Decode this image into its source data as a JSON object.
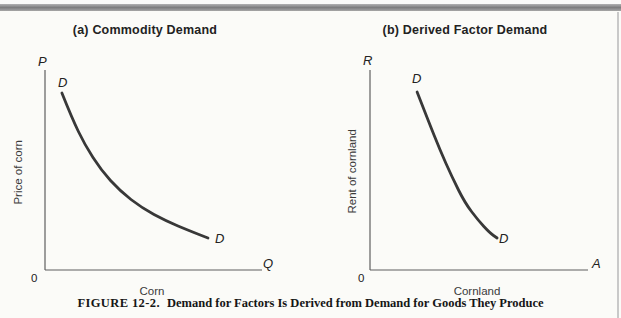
{
  "colors": {
    "paper": "#fbfbf8",
    "curve": "#383838",
    "axis": "#5f5f5f",
    "text": "#222222",
    "top_rule": "#8e8e8e"
  },
  "caption": {
    "label": "FIGURE 12-2.",
    "text": "Demand for Factors Is Derived from Demand for Goods They Produce"
  },
  "chart_data": [
    {
      "type": "line",
      "title": "(a) Commodity Demand",
      "xlabel": "Corn",
      "ylabel": "Price of corn",
      "x_axis_end_symbol": "Q",
      "y_axis_end_symbol": "P",
      "origin_label": "0",
      "curve_start_label": "D",
      "curve_end_label": "D",
      "xlim": [
        0,
        1
      ],
      "ylim": [
        0,
        1
      ],
      "grid": false,
      "legend": "none",
      "series": [
        {
          "name": "D",
          "x": [
            0.078,
            0.124,
            0.184,
            0.258,
            0.346,
            0.447,
            0.558,
            0.668,
            0.751
          ],
          "y": [
            0.885,
            0.76,
            0.625,
            0.5,
            0.395,
            0.31,
            0.245,
            0.195,
            0.16
          ]
        }
      ]
    },
    {
      "type": "line",
      "title": "(b) Derived Factor Demand",
      "xlabel": "Cornland",
      "ylabel": "Rent of cornland",
      "x_axis_end_symbol": "A",
      "y_axis_end_symbol": "R",
      "origin_label": "0",
      "curve_start_label": "D",
      "curve_end_label": "D",
      "xlim": [
        0,
        1
      ],
      "ylim": [
        0,
        1
      ],
      "grid": false,
      "legend": "none",
      "series": [
        {
          "name": "D",
          "x": [
            0.216,
            0.266,
            0.321,
            0.376,
            0.436,
            0.495,
            0.55,
            0.583
          ],
          "y": [
            0.89,
            0.75,
            0.6,
            0.465,
            0.335,
            0.25,
            0.185,
            0.16
          ]
        }
      ]
    }
  ]
}
